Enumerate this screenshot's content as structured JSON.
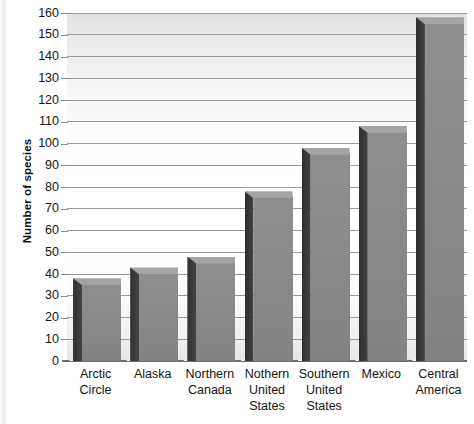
{
  "chart_data": {
    "type": "bar",
    "title": "",
    "subtitle": "",
    "xlabel": "",
    "ylabel": "Number of species",
    "categories": [
      "Arctic Circle",
      "Alaska",
      "Northern Canada",
      "Nothern United States",
      "Southern United States",
      "Mexico",
      "Central America"
    ],
    "category_lines": [
      [
        "Arctic",
        "Circle"
      ],
      [
        "Alaska"
      ],
      [
        "Northern",
        "Canada"
      ],
      [
        "Nothern",
        "United",
        "States"
      ],
      [
        "Southern",
        "United",
        "States"
      ],
      [
        "Mexico"
      ],
      [
        "Central",
        "America"
      ]
    ],
    "values": [
      38,
      43,
      48,
      78,
      98,
      108,
      158
    ],
    "ylim": [
      0,
      160
    ],
    "ytick_step": 10,
    "yticks": [
      0,
      10,
      20,
      30,
      40,
      50,
      60,
      70,
      80,
      90,
      100,
      110,
      120,
      130,
      140,
      150,
      160
    ],
    "grid": true,
    "legend": false,
    "legend_position": "none",
    "style": "3d-bars-grayscale",
    "colors": {
      "bar_front": "#8a8a8a",
      "bar_side": "#3a3a3a",
      "bar_top": "#a4a4a4",
      "grid": "#9a9a9a",
      "axis": "#6d6d6d",
      "text": "#141414",
      "plot_background": "#ffffff"
    }
  }
}
